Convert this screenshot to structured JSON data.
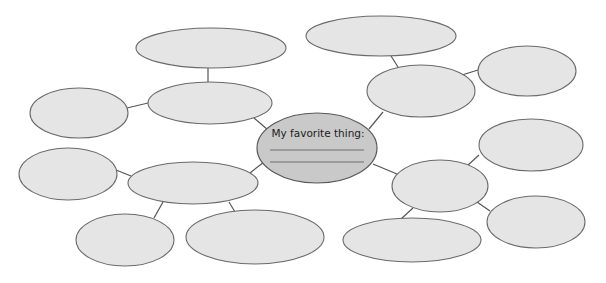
{
  "diagram": {
    "type": "bubble-map",
    "center": {
      "label": "My favorite thing:",
      "answer_lines": 2,
      "fill": "#c9c9c9"
    },
    "bubble_fill": "#e5e5e5",
    "stroke": "#6a6a6a",
    "branches": [
      {
        "name": "upper-left",
        "children": 2
      },
      {
        "name": "upper-right",
        "children": 2
      },
      {
        "name": "lower-left",
        "children": 3
      },
      {
        "name": "lower-right",
        "children": 3
      }
    ]
  }
}
